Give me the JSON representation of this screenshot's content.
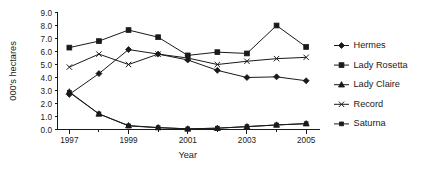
{
  "chart_data": {
    "type": "line",
    "title": "",
    "xlabel": "Year",
    "ylabel": "000's hectares",
    "x": [
      1997,
      1998,
      1999,
      2000,
      2001,
      2002,
      2003,
      2004,
      2005
    ],
    "xtick_labels": [
      "1997",
      "1999",
      "2001",
      "2003",
      "2005"
    ],
    "xtick_values": [
      1997,
      1999,
      2001,
      2003,
      2005
    ],
    "ytick_labels": [
      "0.0",
      "1.0",
      "2.0",
      "3.0",
      "4.0",
      "5.0",
      "6.0",
      "7.0",
      "8.0",
      "9.0"
    ],
    "ytick_values": [
      0.0,
      1.0,
      2.0,
      3.0,
      4.0,
      5.0,
      6.0,
      7.0,
      8.0,
      9.0
    ],
    "xlim": [
      1996.6,
      2005.4
    ],
    "ylim": [
      0.0,
      9.0
    ],
    "grid": false,
    "legend_position": "right",
    "series": [
      {
        "name": "Hermes",
        "marker": "diamond",
        "values": [
          2.7,
          4.3,
          6.15,
          5.8,
          5.35,
          4.55,
          4.0,
          4.05,
          3.75
        ]
      },
      {
        "name": "Lady Rosetta",
        "marker": "square",
        "values": [
          6.3,
          6.8,
          7.65,
          7.1,
          5.7,
          5.95,
          5.85,
          8.0,
          6.35
        ]
      },
      {
        "name": "Lady Claire",
        "marker": "triangle",
        "values": [
          2.9,
          1.2,
          0.3,
          0.15,
          0.05,
          0.1,
          0.22,
          0.35,
          0.45
        ]
      },
      {
        "name": "Record",
        "marker": "x",
        "values": [
          4.8,
          5.8,
          5.0,
          5.8,
          5.5,
          5.0,
          5.25,
          5.45,
          5.55
        ]
      },
      {
        "name": "Saturna",
        "marker": "small-square",
        "values": [
          2.85,
          1.2,
          0.28,
          0.14,
          0.05,
          0.1,
          0.22,
          0.35,
          0.45
        ]
      }
    ]
  }
}
